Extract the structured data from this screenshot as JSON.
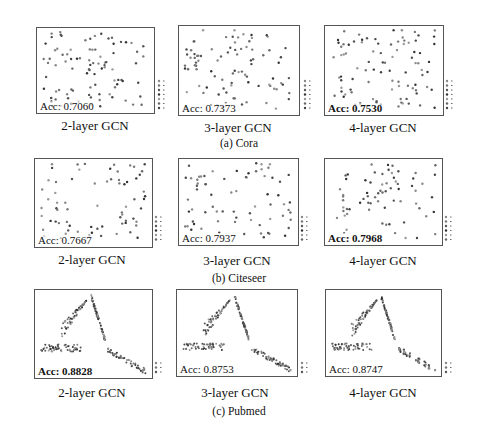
{
  "chart_data": [
    {
      "type": "scatter",
      "dataset": "Cora",
      "title": "2-layer GCN",
      "annotation": "Acc: 0.7060",
      "bold": false,
      "legend_classes": 7,
      "xticks": [
        "-60",
        "-40",
        "-20",
        "0",
        "20",
        "40",
        "60",
        "80"
      ],
      "yticks": [
        "80",
        "60",
        "40",
        "20",
        "0",
        "-20",
        "-40",
        "-60"
      ],
      "grid": false
    },
    {
      "type": "scatter",
      "dataset": "Cora",
      "title": "3-layer GCN",
      "annotation": "Acc: 0.7373",
      "bold": false,
      "legend_classes": 7,
      "xticks": [
        "-50",
        "-25",
        "0",
        "25",
        "50",
        "75",
        "100"
      ],
      "yticks": [
        "100",
        "75",
        "50",
        "25",
        "0",
        "-25",
        "-50"
      ],
      "grid": false
    },
    {
      "type": "scatter",
      "dataset": "Cora",
      "title": "4-layer GCN",
      "annotation": "Acc: 0.7530",
      "bold": true,
      "legend_classes": 7,
      "xticks": [
        "-40",
        "-20",
        "0",
        "20",
        "40",
        "60"
      ],
      "yticks": [
        "80",
        "60",
        "40",
        "20",
        "0",
        "-20",
        "-40"
      ],
      "grid": false
    },
    {
      "type": "scatter",
      "dataset": "Citeseer",
      "title": "2-layer GCN",
      "annotation": "Acc: 0.7667",
      "bold": false,
      "legend_classes": 6,
      "xticks": [
        "-100",
        "-50",
        "0",
        "50",
        "100"
      ],
      "yticks": [
        "100",
        "50",
        "0",
        "-50",
        "-100"
      ],
      "grid": false
    },
    {
      "type": "scatter",
      "dataset": "Citeseer",
      "title": "3-layer GCN",
      "annotation": "Acc: 0.7937",
      "bold": false,
      "legend_classes": 6,
      "xticks": [
        "-40",
        "-20",
        "0",
        "20",
        "40"
      ],
      "yticks": [
        "40",
        "30",
        "20",
        "10",
        "0",
        "-10",
        "-20",
        "-30"
      ],
      "grid": false
    },
    {
      "type": "scatter",
      "dataset": "Citeseer",
      "title": "4-layer GCN",
      "annotation": "Acc: 0.7968",
      "bold": true,
      "legend_classes": 6,
      "xticks": [
        "-40",
        "-30",
        "-20",
        "-10",
        "0",
        "10",
        "20",
        "30",
        "40"
      ],
      "yticks": [
        "40",
        "30",
        "20",
        "10",
        "0",
        "-10",
        "-20",
        "-30"
      ],
      "grid": false
    },
    {
      "type": "scatter",
      "dataset": "Pubmed",
      "title": "2-layer GCN",
      "annotation": "Acc: 0.8828",
      "bold": true,
      "legend_classes": 3,
      "xticks": [
        "-10",
        "-5",
        "0",
        "5",
        "10"
      ],
      "yticks": [
        "10.0",
        "7.5",
        "5.0",
        "2.5",
        "0.0",
        "-2.5",
        "-5.0",
        "-7.5"
      ],
      "grid": false
    },
    {
      "type": "scatter",
      "dataset": "Pubmed",
      "title": "3-layer GCN",
      "annotation": "Acc: 0.8753",
      "bold": false,
      "legend_classes": 3,
      "xticks": [
        "-10",
        "-5",
        "0",
        "5"
      ],
      "yticks": [
        "10",
        "5",
        "0",
        "-5",
        "-10"
      ],
      "grid": false
    },
    {
      "type": "scatter",
      "dataset": "Pubmed",
      "title": "4-layer GCN",
      "annotation": "Acc: 0.8747",
      "bold": false,
      "legend_classes": 3,
      "xticks": [
        "-10",
        "-5",
        "0",
        "5",
        "10"
      ],
      "yticks": [
        "12.5",
        "10.0",
        "7.5",
        "5.0",
        "2.5",
        "0.0",
        "-2.5",
        "-5.0",
        "-7.5",
        "-10.0"
      ],
      "grid": false
    }
  ],
  "captions": {
    "cora": "(a) Cora",
    "citeseer": "(b) Citeseer",
    "pubmed": "(c) Pubmed"
  },
  "titles": [
    "2-layer GCN",
    "3-layer GCN",
    "4-layer GCN",
    "2-layer GCN",
    "3-layer GCN",
    "4-layer GCN",
    "2-layer GCN",
    "3-layer GCN",
    "4-layer GCN"
  ],
  "accs": [
    "Acc: 0.7060",
    "Acc: 0.7373",
    "Acc: 0.7530",
    "Acc: 0.7667",
    "Acc: 0.7937",
    "Acc: 0.7968",
    "Acc: 0.8828",
    "Acc: 0.8753",
    "Acc: 0.8747"
  ]
}
